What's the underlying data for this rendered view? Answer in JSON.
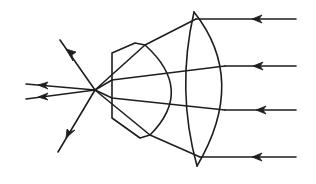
{
  "figure": {
    "title": "Ray diagram: parallel rays through a converging lens pair",
    "description": "Four parallel incoming rays from the right pass through a biconvex lens and a hexagonal-profile lens, converge to a focal point, then diverge to the left.",
    "colors": {
      "background": "#ffffff",
      "ink": "#1e1e1e"
    },
    "incoming_rays": [
      {
        "id": "ray-1",
        "y": 19,
        "direction": "leftward"
      },
      {
        "id": "ray-2",
        "y": 66,
        "direction": "leftward"
      },
      {
        "id": "ray-3",
        "y": 110,
        "direction": "leftward"
      },
      {
        "id": "ray-4",
        "y": 157,
        "direction": "leftward"
      }
    ],
    "lenses": [
      {
        "id": "biconvex-lens",
        "type": "biconvex",
        "position": "right"
      },
      {
        "id": "hexagonal-lens",
        "type": "plano-convex with faceted edge",
        "position": "left"
      }
    ],
    "focal_point": {
      "x": 95,
      "y": 90
    },
    "outgoing_rays": [
      {
        "id": "out-upper-left",
        "direction": "up-left"
      },
      {
        "id": "out-left-upper",
        "direction": "left"
      },
      {
        "id": "out-left-lower",
        "direction": "left"
      },
      {
        "id": "out-lower-left",
        "direction": "down-left"
      }
    ]
  }
}
